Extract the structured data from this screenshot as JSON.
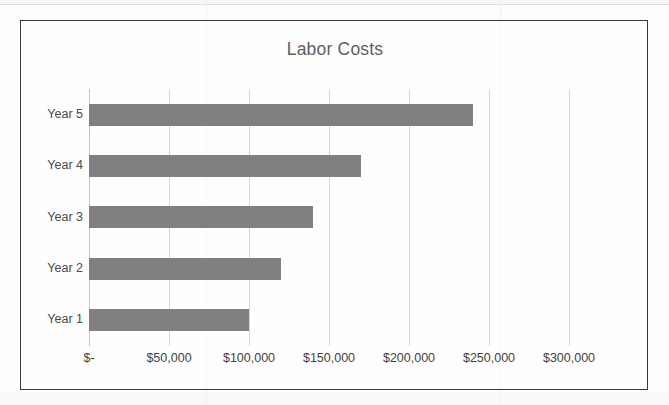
{
  "chart_data": {
    "type": "bar",
    "orientation": "horizontal",
    "title": "Labor Costs",
    "xlabel": "",
    "ylabel": "",
    "categories": [
      "Year 5",
      "Year 4",
      "Year 3",
      "Year 2",
      "Year 1"
    ],
    "values": [
      240000,
      170000,
      140000,
      120000,
      100000
    ],
    "series": [
      {
        "name": "Labor Costs",
        "values": [
          240000,
          170000,
          140000,
          120000,
          100000
        ]
      }
    ],
    "xlim": [
      0,
      325000
    ],
    "xticks": [
      0,
      50000,
      100000,
      150000,
      200000,
      250000,
      300000
    ],
    "xtick_labels": [
      "$-",
      "$50,000",
      "$100,000",
      "$150,000",
      "$200,000",
      "$250,000",
      "$300,000"
    ],
    "grid": "vertical",
    "legend": "none",
    "bar_color": "#808080",
    "title_color": "#5f5f5f",
    "gridline_color": "#d6d6d6"
  }
}
